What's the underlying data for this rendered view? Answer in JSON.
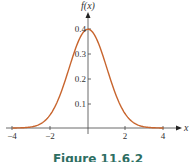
{
  "chart_data": {
    "type": "line",
    "title": "",
    "xlabel": "x",
    "ylabel": "f(x)",
    "xlim": [
      -4,
      4
    ],
    "ylim": [
      0,
      0.4
    ],
    "x_ticks": [
      "-4",
      "-2",
      "2",
      "4"
    ],
    "y_ticks": [
      "0.1",
      "0.2",
      "0.3",
      "0.4"
    ],
    "grid": false,
    "legend": null,
    "series": [
      {
        "name": "standard normal density",
        "color": "#c8652e",
        "x": [
          -4,
          -3.5,
          -3,
          -2.5,
          -2,
          -1.5,
          -1,
          -0.5,
          0,
          0.5,
          1,
          1.5,
          2,
          2.5,
          3,
          3.5,
          4
        ],
        "values": [
          0.0001,
          0.0009,
          0.0044,
          0.0175,
          0.054,
          0.1295,
          0.242,
          0.3521,
          0.3989,
          0.3521,
          0.242,
          0.1295,
          0.054,
          0.0175,
          0.0044,
          0.0009,
          0.0001
        ]
      }
    ]
  },
  "labels": {
    "y_axis": "f(x)",
    "x_axis": "x",
    "x_tick_neg4": "−4",
    "x_tick_neg2": "−2",
    "x_tick_2": "2",
    "x_tick_4": "4",
    "y_tick_01": "0.1",
    "y_tick_02": "0.2",
    "y_tick_03": "0.3",
    "y_tick_04": "0.4",
    "caption": "Figure 11.6.2"
  },
  "colors": {
    "curve": "#c8652e",
    "axis": "#333333",
    "caption": "#2e6e62"
  }
}
